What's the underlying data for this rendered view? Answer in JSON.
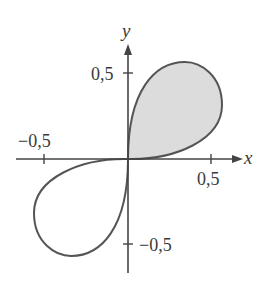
{
  "figure": {
    "axes": {
      "x_label": "x",
      "y_label": "y",
      "x_ticks": [
        {
          "value": -0.5,
          "label": "−0,5"
        },
        {
          "value": 0.5,
          "label": "0,5"
        }
      ],
      "y_ticks": [
        {
          "value": 0.5,
          "label": "0,5"
        },
        {
          "value": -0.5,
          "label": "−0,5"
        }
      ]
    },
    "curve": {
      "stroke_color": "#555555",
      "lobes": [
        {
          "quadrant": "I",
          "shaded": true,
          "fill_color": "#dcdcdc"
        },
        {
          "quadrant": "III",
          "shaded": false
        }
      ]
    },
    "axis_color": "#444444"
  }
}
